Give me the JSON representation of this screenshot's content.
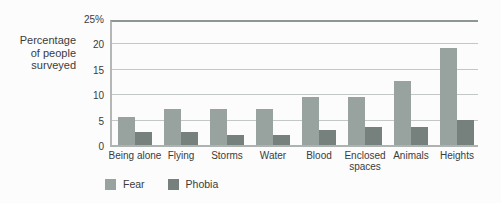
{
  "chart_data": {
    "type": "bar",
    "title": "",
    "ylabel": "Percentage of people surveyed",
    "ylabel_lines": "Percentage\nof people\nsurveyed",
    "xlabel": "",
    "categories": [
      "Being alone",
      "Flying",
      "Storms",
      "Water",
      "Blood",
      "Enclosed spaces",
      "Animals",
      "Heights"
    ],
    "series": [
      {
        "name": "Fear",
        "color": "#98a3a0",
        "values": [
          5.5,
          7,
          7,
          7,
          9.5,
          9.5,
          12.5,
          19
        ]
      },
      {
        "name": "Phobia",
        "color": "#76817e",
        "values": [
          2.5,
          2.5,
          2,
          2,
          3,
          3.5,
          3.5,
          5
        ]
      }
    ],
    "y_ticks": [
      {
        "value": 25,
        "label": "25%"
      },
      {
        "value": 20,
        "label": "20"
      },
      {
        "value": 15,
        "label": "15"
      },
      {
        "value": 10,
        "label": "10"
      },
      {
        "value": 5,
        "label": "5"
      },
      {
        "value": 0,
        "label": "0"
      }
    ],
    "ylim": [
      0,
      25
    ],
    "grid": true,
    "legend_position": "bottom-left",
    "legend_labels": [
      "Fear",
      "Phobia"
    ]
  },
  "colors": {
    "fear_bar": "#98a3a0",
    "phobia_bar": "#76817e",
    "gridline": "#c3c8c6",
    "top_rule": "#8f9795",
    "axis": "#adb3b1",
    "text": "#3b3b3b",
    "background": "#fcfcfc"
  }
}
